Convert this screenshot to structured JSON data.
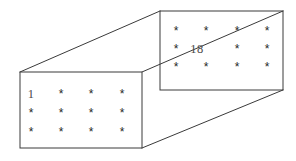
{
  "figure": {
    "type": "wireframe-box",
    "background_color": "#ffffff",
    "line_color": "#3a3a3a",
    "text_color": "#2b2b2b",
    "star_glyph": "*",
    "geometry": {
      "front_face": {
        "left": 20,
        "top": 72,
        "right": 142,
        "bottom": 148
      },
      "back_face": {
        "left": 160,
        "top": 11,
        "right": 283,
        "bottom": 90
      },
      "connector_edges": [
        {
          "from_x": 20,
          "from_y": 72,
          "to_x": 160,
          "to_y": 11
        },
        {
          "from_x": 142,
          "from_y": 72,
          "to_x": 283,
          "to_y": 11
        },
        {
          "from_x": 142,
          "from_y": 148,
          "to_x": 283,
          "to_y": 90
        }
      ]
    },
    "front_face": {
      "label": "front-face",
      "columns": 4,
      "rows": 3,
      "cells": [
        [
          "1",
          "*",
          "*",
          "*"
        ],
        [
          "*",
          "*",
          "*",
          "*"
        ],
        [
          "*",
          "*",
          "*",
          "*"
        ]
      ]
    },
    "back_face": {
      "label": "back-face",
      "columns": 4,
      "rows": 3,
      "cells": [
        [
          "*",
          "*",
          "*",
          "*"
        ],
        [
          "*",
          "18",
          "*",
          "*"
        ],
        [
          "*",
          "*",
          "*",
          "*"
        ]
      ]
    },
    "annotations": {
      "first_index": "1",
      "last_index": "18"
    }
  }
}
